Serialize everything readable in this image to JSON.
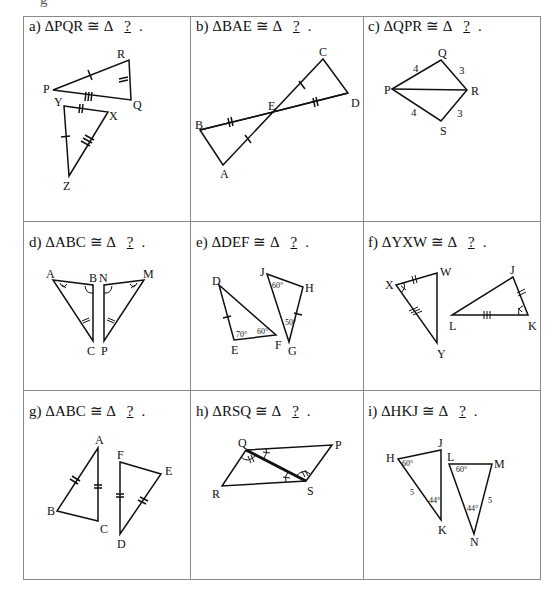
{
  "header_fragment": "g",
  "problems": [
    {
      "id": "a",
      "prefix": "a)",
      "given": "PQR",
      "blank": "?",
      "vertices": [
        "P",
        "Q",
        "R",
        "Y",
        "X",
        "Z"
      ]
    },
    {
      "id": "b",
      "prefix": "b)",
      "given": "BAE",
      "blank": "?",
      "vertices": [
        "B",
        "A",
        "E",
        "C",
        "D"
      ]
    },
    {
      "id": "c",
      "prefix": "c)",
      "given": "QPR",
      "blank": "?",
      "vertices": [
        "Q",
        "P",
        "R",
        "S"
      ],
      "side_lengths": [
        "4",
        "3",
        "4",
        "3"
      ]
    },
    {
      "id": "d",
      "prefix": "d)",
      "given": "ABC",
      "blank": "?",
      "vertices": [
        "A",
        "B",
        "N",
        "M",
        "C",
        "P"
      ]
    },
    {
      "id": "e",
      "prefix": "e)",
      "given": "DEF",
      "blank": "?",
      "vertices": [
        "D",
        "E",
        "F",
        "J",
        "H",
        "G"
      ],
      "angles": [
        "70°",
        "60°",
        "60°",
        "50°"
      ]
    },
    {
      "id": "f",
      "prefix": "f)",
      "given": "YXW",
      "blank": "?",
      "vertices": [
        "X",
        "W",
        "Y",
        "J",
        "L",
        "K"
      ]
    },
    {
      "id": "g",
      "prefix": "g)",
      "given": "ABC",
      "blank": "?",
      "vertices": [
        "A",
        "B",
        "C",
        "F",
        "E",
        "D"
      ]
    },
    {
      "id": "h",
      "prefix": "h)",
      "given": "RSQ",
      "blank": "?",
      "vertices": [
        "Q",
        "P",
        "R",
        "S"
      ]
    },
    {
      "id": "i",
      "prefix": "i)",
      "given": "HKJ",
      "blank": "?",
      "vertices": [
        "H",
        "J",
        "K",
        "L",
        "M",
        "N"
      ],
      "angles": [
        "60°",
        "44°",
        "60°",
        "44°"
      ],
      "side_lengths": [
        "5",
        "5"
      ]
    }
  ],
  "symbols": {
    "delta": "Δ",
    "congruent": "≅"
  }
}
